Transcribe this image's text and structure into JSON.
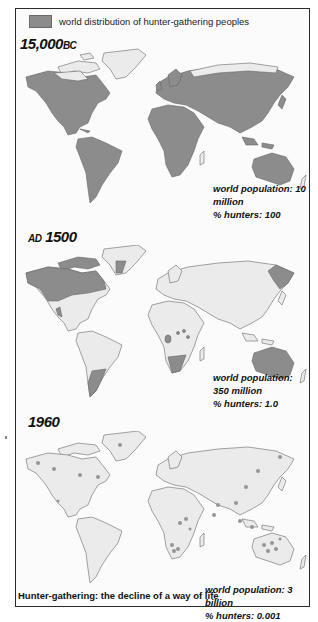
{
  "legend": {
    "swatch_color": "#8c8c8c",
    "label": "world distribution of hunter-gathering peoples"
  },
  "colors": {
    "hunter_gatherer_land": "#8c8c8c",
    "other_land": "#ebebeb",
    "ocean": "#fbfbfb",
    "coastline": "#666666",
    "hunter_dot": "#959595"
  },
  "periods": [
    {
      "label_number": "15,000",
      "label_era": "BC",
      "population_label": "world population: 10 million",
      "hunters_label": "% hunters: 100"
    },
    {
      "label_era": "AD",
      "label_number": "1500",
      "population_label": "world population: 350 million",
      "hunters_label": "% hunters: 1.0"
    },
    {
      "label_number": "1960",
      "population_label": "world population: 3 billion",
      "hunters_label": "% hunters: 0.001"
    }
  ],
  "caption": "Hunter-gathering: the decline of a way of life"
}
